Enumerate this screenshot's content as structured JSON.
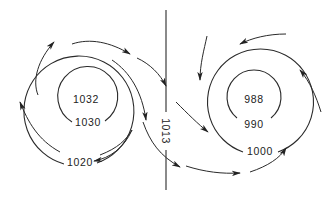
{
  "diagram": {
    "type": "pressure-systems",
    "colors": {
      "ink": "#2a2a2a",
      "background": "#ffffff"
    },
    "high_pressure": {
      "name": "anticyclone",
      "center_label": "1032",
      "isobars": [
        "1030",
        "1020"
      ],
      "circulation": "clockwise-outflow"
    },
    "low_pressure": {
      "name": "cyclone",
      "center_label": "988",
      "isobars": [
        "990",
        "1000"
      ],
      "circulation": "counterclockwise-inflow"
    },
    "divider": {
      "label": "1013",
      "orientation": "vertical"
    }
  }
}
